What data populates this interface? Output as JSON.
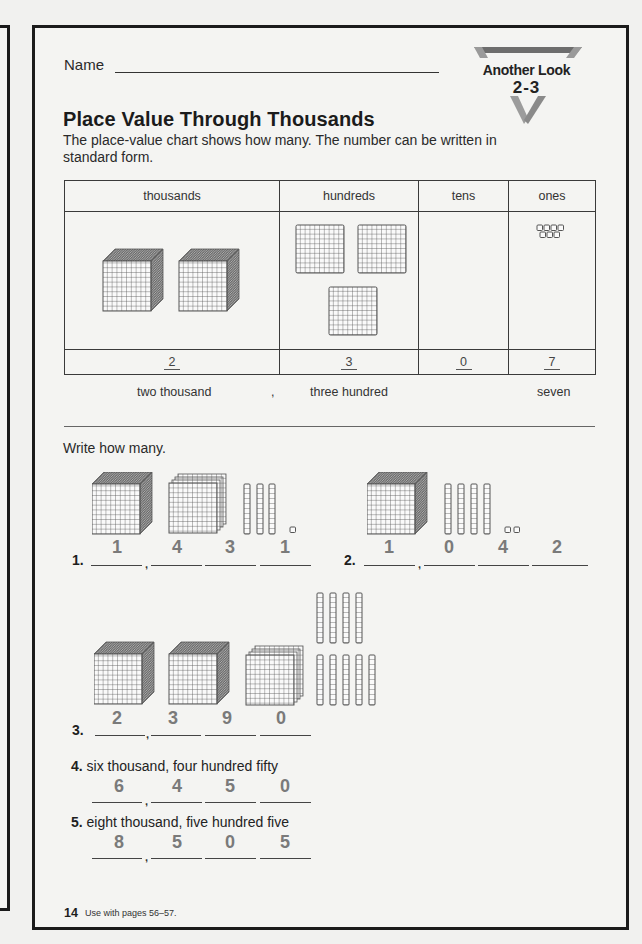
{
  "header": {
    "name_label": "Name",
    "badge_title": "Another Look",
    "badge_number": "2-3"
  },
  "lesson": {
    "title": "Place Value Through Thousands",
    "intro": "The place-value chart shows how many. The number can be written in standard form."
  },
  "place_value_chart": {
    "columns": [
      {
        "header": "thousands",
        "blocks": 2,
        "block_type": "cube",
        "value": "2",
        "words": "two thousand"
      },
      {
        "header": "hundreds",
        "blocks": 3,
        "block_type": "flat",
        "value": "3",
        "words": "three hundred"
      },
      {
        "header": "tens",
        "blocks": 0,
        "block_type": "rod",
        "value": "0",
        "words": ""
      },
      {
        "header": "ones",
        "blocks": 7,
        "block_type": "unit",
        "value": "7",
        "words": "seven"
      }
    ],
    "words_separator": ","
  },
  "exercise": {
    "instruction": "Write how many.",
    "problems": [
      {
        "number": "1.",
        "prompt": "",
        "answer": [
          "1",
          "4",
          "3",
          "1"
        ],
        "blocks": {
          "thousands": 1,
          "hundreds": 4,
          "tens": 3,
          "ones": 1
        }
      },
      {
        "number": "2.",
        "prompt": "",
        "answer": [
          "1",
          "0",
          "4",
          "2"
        ],
        "blocks": {
          "thousands": 1,
          "hundreds": 0,
          "tens": 4,
          "ones": 2
        }
      },
      {
        "number": "3.",
        "prompt": "",
        "answer": [
          "2",
          "3",
          "9",
          "0"
        ],
        "blocks": {
          "thousands": 2,
          "hundreds": 3,
          "tens": 9,
          "ones": 0
        }
      },
      {
        "number": "4.",
        "prompt": "six thousand, four hundred fifty",
        "answer": [
          "6",
          "4",
          "5",
          "0"
        ]
      },
      {
        "number": "5.",
        "prompt": "eight thousand, five hundred five",
        "answer": [
          "8",
          "5",
          "0",
          "5"
        ]
      }
    ],
    "comma": ","
  },
  "footer": {
    "page_number": "14",
    "note": "Use with pages 56–57."
  },
  "colors": {
    "page_background": "#f4f4f2",
    "border": "#1b1b1b",
    "answer_digits": "#7a7a7a",
    "badge_gray": "#8a8a8a"
  }
}
